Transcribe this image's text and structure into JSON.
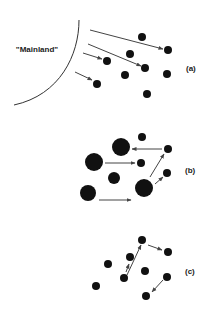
{
  "figure": {
    "mainland_label": "\"Mainland\"",
    "panels": [
      {
        "label": "(a)",
        "label_pos": [
          186,
          71
        ],
        "description": "Colonization of islands from mainland",
        "dots": [
          {
            "x": 142,
            "y": 37,
            "r": 4
          },
          {
            "x": 168,
            "y": 50,
            "r": 4
          },
          {
            "x": 130,
            "y": 54,
            "r": 4
          },
          {
            "x": 107,
            "y": 61,
            "r": 4
          },
          {
            "x": 145,
            "y": 68,
            "r": 4
          },
          {
            "x": 125,
            "y": 75,
            "r": 4
          },
          {
            "x": 167,
            "y": 74,
            "r": 4
          },
          {
            "x": 97,
            "y": 84,
            "r": 4
          },
          {
            "x": 147,
            "y": 94,
            "r": 4
          }
        ],
        "arrows": [
          {
            "x1": 90,
            "y1": 30,
            "x2": 163,
            "y2": 49
          },
          {
            "x1": 88,
            "y1": 44,
            "x2": 141,
            "y2": 66
          },
          {
            "x1": 83,
            "y1": 53,
            "x2": 102,
            "y2": 59
          },
          {
            "x1": 75,
            "y1": 72,
            "x2": 92,
            "y2": 80
          }
        ]
      },
      {
        "label": "(b)",
        "label_pos": [
          185,
          173
        ],
        "description": "Mainland-island (core-satellite) metapopulation",
        "dots": [
          {
            "x": 142,
            "y": 137,
            "r": 4
          },
          {
            "x": 121,
            "y": 147,
            "r": 9
          },
          {
            "x": 168,
            "y": 149,
            "r": 4
          },
          {
            "x": 94,
            "y": 162,
            "r": 9
          },
          {
            "x": 141,
            "y": 163,
            "r": 4
          },
          {
            "x": 114,
            "y": 178,
            "r": 6
          },
          {
            "x": 167,
            "y": 173,
            "r": 4
          },
          {
            "x": 144,
            "y": 188,
            "r": 9
          },
          {
            "x": 88,
            "y": 193,
            "r": 8
          }
        ],
        "arrows": [
          {
            "x1": 162,
            "y1": 149,
            "x2": 132,
            "y2": 149
          },
          {
            "x1": 105,
            "y1": 163,
            "x2": 135,
            "y2": 163
          },
          {
            "x1": 150,
            "y1": 177,
            "x2": 164,
            "y2": 154
          },
          {
            "x1": 155,
            "y1": 184,
            "x2": 163,
            "y2": 177
          },
          {
            "x1": 99,
            "y1": 200,
            "x2": 131,
            "y2": 200
          }
        ]
      },
      {
        "label": "(c)",
        "label_pos": [
          185,
          274
        ],
        "description": "Classic metapopulation with equal patches",
        "dots": [
          {
            "x": 142,
            "y": 240,
            "r": 4
          },
          {
            "x": 168,
            "y": 252,
            "r": 4
          },
          {
            "x": 130,
            "y": 257,
            "r": 4
          },
          {
            "x": 108,
            "y": 264,
            "r": 4
          },
          {
            "x": 145,
            "y": 271,
            "r": 4
          },
          {
            "x": 124,
            "y": 278,
            "r": 4
          },
          {
            "x": 167,
            "y": 277,
            "r": 4
          },
          {
            "x": 96,
            "y": 286,
            "r": 4
          },
          {
            "x": 146,
            "y": 296,
            "r": 4
          }
        ],
        "arrows": [
          {
            "x1": 127,
            "y1": 275,
            "x2": 141,
            "y2": 245
          },
          {
            "x1": 126,
            "y1": 272,
            "x2": 129,
            "y2": 264
          },
          {
            "x1": 148,
            "y1": 245,
            "x2": 162,
            "y2": 250
          },
          {
            "x1": 163,
            "y1": 280,
            "x2": 152,
            "y2": 292
          }
        ]
      }
    ],
    "colors": {
      "dot": "#111111",
      "arrow": "#444444",
      "mainland_line": "#333333",
      "text": "#1a1a1a"
    }
  }
}
